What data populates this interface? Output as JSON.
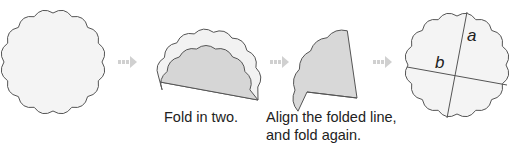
{
  "diagram": {
    "steps": [
      {
        "id": "circle",
        "caption": ""
      },
      {
        "id": "fold-in-two",
        "caption": "Fold in two."
      },
      {
        "id": "fold-again",
        "caption_line1": "Align the folded line,",
        "caption_line2": "and fold again."
      },
      {
        "id": "result",
        "caption": ""
      }
    ],
    "labels": {
      "a": "a",
      "b": "b"
    },
    "arrows": [
      "arrow-right-icon",
      "arrow-right-icon",
      "arrow-right-icon"
    ],
    "colors": {
      "paper_light": "#f2f2f2",
      "paper_dark": "#d6d6d6",
      "outline": "#555555",
      "arrow": "#d0d0d0"
    }
  }
}
